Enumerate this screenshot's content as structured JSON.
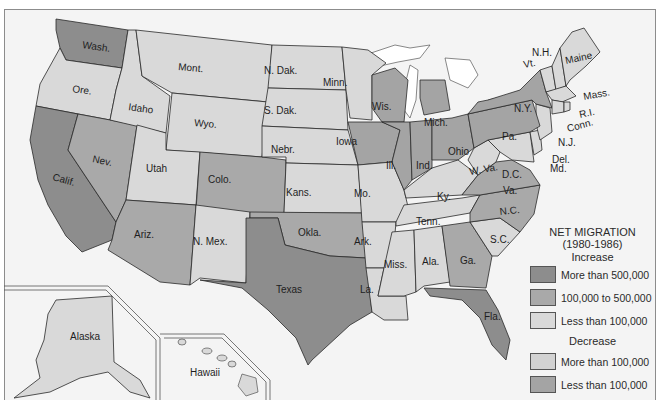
{
  "title_fragment": "",
  "legend": {
    "title": "NET MIGRATION",
    "period": "(1980-1986)",
    "increase_heading": "Increase",
    "decrease_heading": "Decrease",
    "increase": [
      {
        "label": "More than 500,000",
        "color": "#8d8d8d"
      },
      {
        "label": "100,000 to 500,000",
        "color": "#a9a9a9"
      },
      {
        "label": "Less than 100,000",
        "color": "#d9d9d9"
      }
    ],
    "decrease": [
      {
        "label": "More than 100,000",
        "color": "#d2d2d2"
      },
      {
        "label": "Less than 100,000",
        "color": "#a4a4a4"
      }
    ]
  },
  "states": {
    "wash": "Wash.",
    "ore": "Ore.",
    "calif": "Calif.",
    "idaho": "Idaho",
    "nev": "Nev.",
    "mont": "Mont.",
    "wyo": "Wyo.",
    "utah": "Utah",
    "colo": "Colo.",
    "ariz": "Ariz.",
    "nmex": "N. Mex.",
    "ndak": "N. Dak.",
    "sdak": "S. Dak.",
    "nebr": "Nebr.",
    "kans": "Kans.",
    "okla": "Okla.",
    "texas": "Texas",
    "minn": "Minn.",
    "iowa": "Iowa",
    "mo": "Mo.",
    "ark": "Ark.",
    "la": "La.",
    "wis": "Wis.",
    "ill": "Ill.",
    "mich": "Mich.",
    "ind": "Ind.",
    "ohio": "Ohio",
    "ky": "Ky.",
    "tenn": "Tenn.",
    "miss": "Miss.",
    "ala": "Ala.",
    "ga": "Ga.",
    "fla": "Fla.",
    "sc": "S.C.",
    "nc": "N.C.",
    "va": "Va.",
    "wva": "W. Va.",
    "dc": "D.C.",
    "md": "Md.",
    "del": "Del.",
    "nj": "N.J.",
    "pa": "Pa.",
    "ny": "N.Y.",
    "conn": "Conn.",
    "ri": "R.I.",
    "mass": "Mass.",
    "vt": "Vt.",
    "nh": "N.H.",
    "maine": "Maine",
    "alaska": "Alaska",
    "hawaii": "Hawaii"
  },
  "classes": {
    "inc_high": [
      "Wash.",
      "Calif.",
      "Texas",
      "Fla."
    ],
    "inc_mid": [
      "Nev.",
      "Ariz.",
      "Colo.",
      "Okla.",
      "Ga.",
      "N.C.",
      "Va."
    ],
    "inc_low": [
      "Ore.",
      "Idaho",
      "Mont.",
      "Wyo.",
      "Utah",
      "N. Mex.",
      "N. Dak.",
      "S. Dak.",
      "Nebr.",
      "Kans.",
      "Minn.",
      "Mo.",
      "Ark.",
      "La.",
      "Ky.",
      "Tenn.",
      "Miss.",
      "Ala.",
      "S.C.",
      "W. Va.",
      "Md.",
      "Del.",
      "N.J.",
      "Conn.",
      "R.I.",
      "Mass.",
      "Vt.",
      "N.H.",
      "Maine",
      "Alaska",
      "Hawaii"
    ],
    "dec_low": [
      "Iowa",
      "Wis.",
      "Ill.",
      "Mich.",
      "Ind.",
      "Ohio",
      "Pa.",
      "N.Y."
    ]
  }
}
